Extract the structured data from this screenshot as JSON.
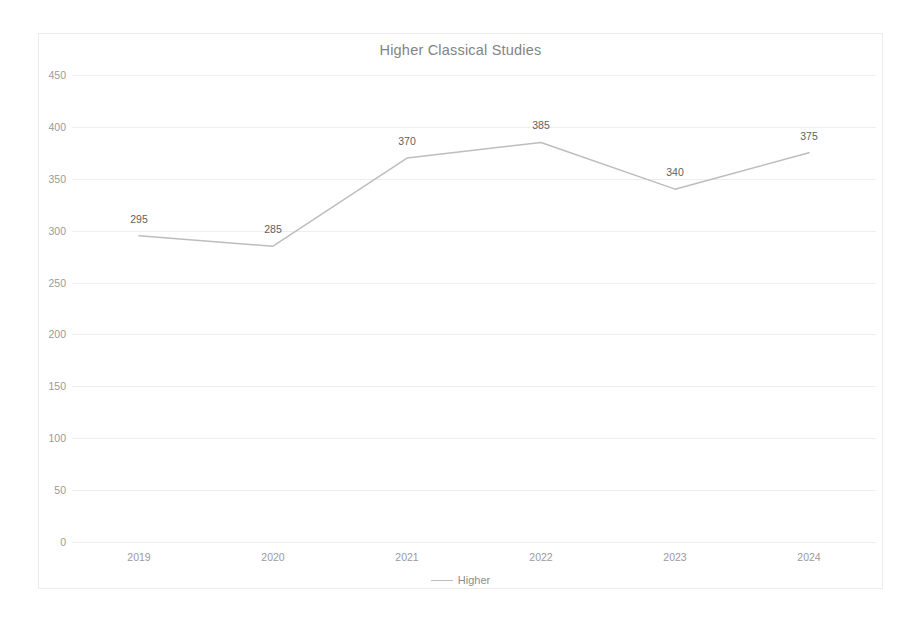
{
  "chart_data": {
    "type": "line",
    "title": "Higher Classical Studies",
    "xlabel": "",
    "ylabel": "",
    "categories": [
      "2019",
      "2020",
      "2021",
      "2022",
      "2023",
      "2024"
    ],
    "series": [
      {
        "name": "Higher",
        "values": [
          295,
          285,
          370,
          385,
          340,
          375
        ],
        "color": "#bdbdbd"
      }
    ],
    "data_labels": [
      "295",
      "285",
      "370",
      "385",
      "340",
      "375"
    ],
    "ylim": [
      0,
      450
    ],
    "ytick_values": [
      0,
      50,
      100,
      150,
      200,
      250,
      300,
      350,
      400,
      450
    ],
    "ytick_labels": [
      "0",
      "50",
      "100",
      "150",
      "200",
      "250",
      "300",
      "350",
      "400",
      "450"
    ],
    "grid": true,
    "grid_color": "#eeeeee",
    "legend_position": "bottom",
    "legend_entries": [
      "Higher"
    ],
    "frame_color": "#ececec",
    "title_color": "#838383",
    "tick_color": "#9a9a9a",
    "label_color": "#5f5f5f",
    "background": "#ffffff"
  },
  "legend": {
    "entry_label": "Higher"
  }
}
